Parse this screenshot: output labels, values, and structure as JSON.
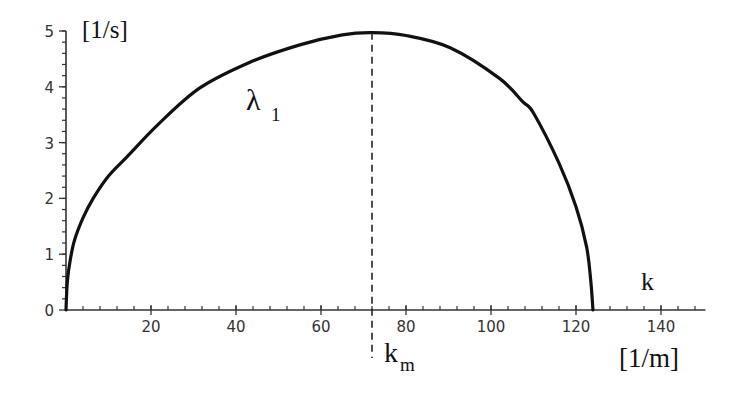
{
  "chart_data": {
    "type": "line",
    "title": "",
    "xlabel": "k",
    "xlabel_unit": "[1/m]",
    "ylabel_unit": "[1/s]",
    "xlim": [
      0,
      150
    ],
    "ylim": [
      0,
      5
    ],
    "x_ticks": [
      20,
      40,
      60,
      80,
      100,
      120,
      140
    ],
    "y_ticks": [
      0,
      1,
      2,
      3,
      4,
      5
    ],
    "x_minor_step": 4,
    "y_minor_step": 0.2,
    "grid": false,
    "legend": null,
    "series": [
      {
        "name": "λ1",
        "label_main": "λ",
        "label_sub": "1",
        "color": "#111111",
        "x": [
          0,
          0.3,
          1,
          2,
          4,
          6.4,
          10,
          14.4,
          22,
          31.5,
          43.3,
          55,
          65,
          72,
          80,
          90.4,
          102,
          107.5,
          110,
          116,
          120,
          122.5,
          123.5,
          124
        ],
        "y": [
          0,
          0.5,
          0.9,
          1.25,
          1.65,
          2.0,
          2.4,
          2.75,
          3.35,
          3.98,
          4.44,
          4.75,
          4.93,
          4.97,
          4.92,
          4.7,
          4.15,
          3.73,
          3.53,
          2.63,
          1.85,
          1.13,
          0.5,
          0
        ]
      }
    ],
    "annotations": [
      {
        "type": "vline",
        "style": "dashed",
        "x": 72,
        "label_main": "k",
        "label_sub": "m",
        "note": "wavenumber of maximum growth rate"
      }
    ]
  },
  "labels": {
    "y_unit": "[1/s]",
    "x_unit": "[1/m]",
    "x_var": "k",
    "curve_main": "λ",
    "curve_sub": "1",
    "km_main": "k",
    "km_sub": "m"
  }
}
